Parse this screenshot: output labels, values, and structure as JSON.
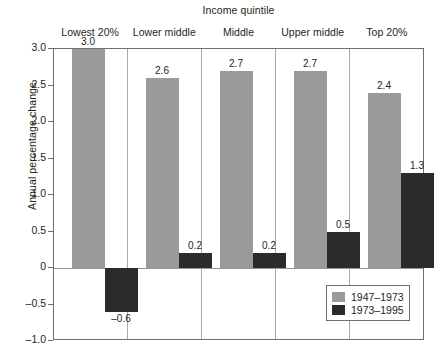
{
  "chart_data": {
    "type": "bar",
    "title": "Income quintile",
    "xlabel": "Income quintile",
    "ylabel": "Annual percentage change",
    "categories": [
      "Lowest 20%",
      "Lower middle",
      "Middle",
      "Upper middle",
      "Top 20%"
    ],
    "series": [
      {
        "name": "1947–1973",
        "color": "#9a9a9a",
        "values": [
          3.0,
          2.6,
          2.7,
          2.7,
          2.4
        ]
      },
      {
        "name": "1973–1995",
        "color": "#2b2b2b",
        "values": [
          -0.6,
          0.2,
          0.2,
          0.5,
          1.3
        ]
      }
    ],
    "value_labels": [
      [
        "3.0",
        "2.6",
        "2.7",
        "2.7",
        "2.4"
      ],
      [
        "–0.6",
        "0.2",
        "0.2",
        "0.5",
        "1.3"
      ]
    ],
    "ylim": [
      -1.0,
      3.0
    ],
    "ytick_values": [
      3.0,
      2.5,
      2.0,
      1.5,
      1.0,
      0.5,
      0.0,
      -0.5,
      -1.0
    ],
    "ytick_labels": [
      "3.0",
      "2.5",
      "2.0",
      "1.5",
      "1.0",
      "0.5",
      "0",
      "–0.5",
      "–1.0"
    ],
    "grid": false,
    "legend_position": "bottom-right",
    "zero_line": true
  },
  "legend": {
    "entries": [
      {
        "label": "1947–1973"
      },
      {
        "label": "1973–1995"
      }
    ]
  }
}
